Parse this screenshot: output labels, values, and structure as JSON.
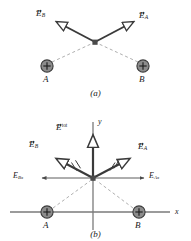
{
  "figure": {
    "panels": [
      {
        "id": "a",
        "caption": "(a)",
        "charges": [
          {
            "name": "A",
            "label": "A",
            "sign": "+",
            "x": 47,
            "y": 66
          },
          {
            "name": "B",
            "label": "B",
            "sign": "+",
            "x": 143,
            "y": 66
          }
        ],
        "field_point": {
          "x": 95,
          "y": 42
        },
        "vectors": [
          {
            "name": "E_B",
            "symbol": "E",
            "subscript": "B",
            "superscript": "",
            "label_x": 38,
            "label_y": 12,
            "from_x": 95,
            "from_y": 42,
            "to_x": 55,
            "to_y": 21
          },
          {
            "name": "E_A",
            "symbol": "E",
            "subscript": "A",
            "superscript": "",
            "label_x": 141,
            "label_y": 14,
            "from_x": 95,
            "from_y": 42,
            "to_x": 135,
            "to_y": 21
          }
        ]
      },
      {
        "id": "b",
        "caption": "(b)",
        "axis_x_label": "x",
        "axis_y_label": "y",
        "charges": [
          {
            "name": "A",
            "label": "A",
            "sign": "+",
            "x": 47,
            "y": 108
          },
          {
            "name": "B",
            "label": "B",
            "sign": "+",
            "x": 139,
            "y": 108
          }
        ],
        "field_point": {
          "x": 93,
          "y": 74
        },
        "vectors": [
          {
            "name": "E_tot",
            "symbol": "E",
            "subscript": "",
            "superscript": "tot",
            "label_x": 58,
            "label_y": 22,
            "from_x": 93,
            "from_y": 74,
            "to_x": 93,
            "to_y": 30
          },
          {
            "name": "E_B",
            "symbol": "E",
            "subscript": "B",
            "superscript": "",
            "label_x": 31,
            "label_y": 38,
            "from_x": 93,
            "from_y": 74,
            "to_x": 55,
            "to_y": 54
          },
          {
            "name": "E_A",
            "symbol": "E",
            "subscript": "A",
            "superscript": "",
            "label_x": 140,
            "label_y": 40,
            "from_x": 93,
            "from_y": 74,
            "to_x": 132,
            "to_y": 54
          },
          {
            "name": "E_Bx",
            "symbol": "E",
            "subscript": "Bx",
            "superscript": "",
            "label_x": 15,
            "label_y": 69,
            "from_x": 93,
            "from_y": 74,
            "to_x": 42,
            "to_y": 74
          },
          {
            "name": "E_Ax",
            "symbol": "E",
            "subscript": "Ax",
            "superscript": "",
            "label_x": 151,
            "label_y": 69,
            "from_x": 93,
            "from_y": 74,
            "to_x": 144,
            "to_y": 74
          }
        ]
      }
    ]
  },
  "colors": {
    "vector": "#3a3a3a",
    "charge_fill": "#8c8c8c",
    "charge_stroke": "#3a3a3a",
    "axis": "#7a7a7a",
    "dashed": "#9a9a9a",
    "text": "#1a1a1a"
  }
}
